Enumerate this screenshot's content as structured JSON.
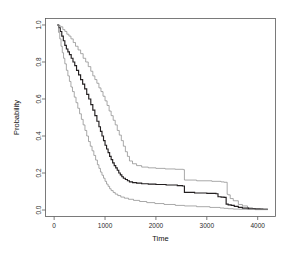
{
  "chart_data": {
    "type": "line",
    "title": "",
    "xlabel": "Time",
    "ylabel": "Probability",
    "xlim": [
      -170,
      4350
    ],
    "ylim": [
      -0.035,
      1.035
    ],
    "grid": false,
    "legend": null,
    "xticks": [
      0,
      1000,
      2000,
      3000,
      4000
    ],
    "xtick_labels": [
      "0",
      "1000",
      "2000",
      "3000",
      "4000"
    ],
    "yticks": [
      0.0,
      0.2,
      0.4,
      0.6,
      0.8,
      1.0
    ],
    "ytick_labels": [
      "0.0",
      "0.2",
      "0.4",
      "0.6",
      "0.8",
      "1.0"
    ],
    "ytick_label_rotation": -90,
    "series": [
      {
        "name": "upper-confidence-bound",
        "color": "#8c8c8c",
        "style": "step",
        "x": [
          60,
          95,
          130,
          170,
          210,
          250,
          290,
          330,
          375,
          420,
          470,
          520,
          570,
          620,
          670,
          720,
          760,
          800,
          840,
          880,
          920,
          960,
          1000,
          1040,
          1080,
          1120,
          1160,
          1200,
          1240,
          1280,
          1320,
          1360,
          1400,
          1440,
          1480,
          1540,
          1620,
          1720,
          1850,
          2000,
          2180,
          2380,
          2540,
          2560,
          2800,
          3100,
          3280,
          3340,
          3400,
          3420,
          3460,
          3520,
          3620,
          3700,
          3800,
          3900,
          4050,
          4200
        ],
        "y": [
          1.0,
          0.995,
          0.99,
          0.975,
          0.965,
          0.95,
          0.94,
          0.925,
          0.905,
          0.885,
          0.865,
          0.845,
          0.82,
          0.8,
          0.775,
          0.75,
          0.725,
          0.705,
          0.685,
          0.66,
          0.64,
          0.615,
          0.59,
          0.565,
          0.535,
          0.51,
          0.485,
          0.46,
          0.43,
          0.405,
          0.375,
          0.345,
          0.315,
          0.29,
          0.265,
          0.25,
          0.24,
          0.232,
          0.228,
          0.225,
          0.222,
          0.22,
          0.218,
          0.162,
          0.158,
          0.155,
          0.152,
          0.15,
          0.085,
          0.082,
          0.062,
          0.05,
          0.03,
          0.022,
          0.012,
          0.008,
          0.005,
          0.005
        ]
      },
      {
        "name": "survival-estimate",
        "color": "#231f20",
        "style": "step",
        "x": [
          60,
          90,
          120,
          150,
          180,
          210,
          240,
          270,
          300,
          335,
          370,
          405,
          440,
          480,
          520,
          560,
          600,
          640,
          680,
          720,
          760,
          800,
          840,
          880,
          910,
          940,
          970,
          1000,
          1030,
          1060,
          1090,
          1120,
          1150,
          1180,
          1210,
          1240,
          1270,
          1300,
          1330,
          1360,
          1400,
          1440,
          1480,
          1540,
          1620,
          1720,
          1850,
          2000,
          2200,
          2420,
          2520,
          2560,
          2760,
          3000,
          3180,
          3220,
          3280,
          3340,
          3380,
          3420,
          3480,
          3540,
          3620,
          3700,
          3820,
          3950,
          4100,
          4200
        ],
        "y": [
          1.0,
          0.985,
          0.965,
          0.94,
          0.915,
          0.89,
          0.87,
          0.855,
          0.84,
          0.82,
          0.8,
          0.78,
          0.755,
          0.73,
          0.705,
          0.68,
          0.655,
          0.625,
          0.6,
          0.57,
          0.54,
          0.51,
          0.48,
          0.45,
          0.425,
          0.4,
          0.375,
          0.35,
          0.33,
          0.31,
          0.29,
          0.272,
          0.255,
          0.24,
          0.228,
          0.215,
          0.2,
          0.19,
          0.18,
          0.172,
          0.165,
          0.158,
          0.152,
          0.148,
          0.145,
          0.142,
          0.14,
          0.138,
          0.135,
          0.132,
          0.13,
          0.095,
          0.092,
          0.09,
          0.088,
          0.072,
          0.07,
          0.068,
          0.032,
          0.028,
          0.025,
          0.02,
          0.014,
          0.01,
          0.007,
          0.005,
          0.004,
          0.004
        ]
      },
      {
        "name": "lower-confidence-bound",
        "color": "#8c8c8c",
        "style": "step",
        "x": [
          60,
          85,
          110,
          135,
          160,
          185,
          210,
          240,
          270,
          300,
          330,
          360,
          395,
          430,
          465,
          500,
          535,
          570,
          605,
          640,
          675,
          710,
          745,
          780,
          815,
          850,
          880,
          910,
          940,
          970,
          1000,
          1030,
          1060,
          1090,
          1120,
          1160,
          1200,
          1250,
          1310,
          1380,
          1460,
          1560,
          1680,
          1820,
          1980,
          2160,
          2380,
          2560,
          2800,
          3060,
          3260,
          3340,
          3420,
          3520,
          3640,
          3780,
          3950,
          4200
        ],
        "y": [
          1.0,
          0.96,
          0.925,
          0.885,
          0.85,
          0.82,
          0.79,
          0.755,
          0.725,
          0.695,
          0.665,
          0.64,
          0.61,
          0.58,
          0.55,
          0.52,
          0.49,
          0.46,
          0.43,
          0.4,
          0.37,
          0.345,
          0.32,
          0.295,
          0.27,
          0.245,
          0.225,
          0.205,
          0.188,
          0.172,
          0.155,
          0.14,
          0.128,
          0.115,
          0.105,
          0.095,
          0.086,
          0.078,
          0.07,
          0.064,
          0.058,
          0.052,
          0.046,
          0.04,
          0.035,
          0.03,
          0.025,
          0.022,
          0.018,
          0.014,
          0.011,
          0.009,
          0.007,
          0.005,
          0.004,
          0.003,
          0.002,
          0.002
        ]
      }
    ]
  }
}
